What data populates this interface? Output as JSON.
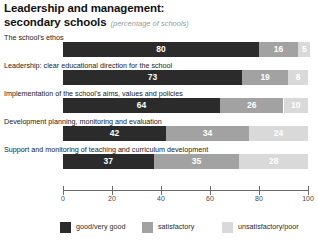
{
  "chart_data": {
    "type": "bar",
    "orientation": "horizontal",
    "stacked": true,
    "percent": true,
    "title": "Leadership and management:",
    "title_line2": "secondary schools",
    "subtitle": "(percentage of schools)",
    "xlabel": "",
    "ylabel": "",
    "xlim": [
      0,
      100
    ],
    "xticks": [
      0,
      20,
      40,
      60,
      80,
      100
    ],
    "xtick_labels": [
      "0",
      "20",
      "40",
      "60",
      "80",
      "100"
    ],
    "grid": false,
    "legend_position": "bottom",
    "categories": [
      "The school's ethos",
      "Leadership: clear educational direction for the school",
      "Implementation of the school's aims, values and policies",
      "Development planning, monitoring and evaluation",
      "Support and monitoring of teaching and curriculum development"
    ],
    "series": [
      {
        "name": "good/very good",
        "color": "#2b2b2b",
        "values": [
          80,
          73,
          64,
          42,
          37
        ]
      },
      {
        "name": "satisfactory",
        "color": "#a2a2a2",
        "values": [
          16,
          19,
          26,
          34,
          35
        ]
      },
      {
        "name": "unsatisfactory/poor",
        "color": "#d9d9d9",
        "values": [
          5,
          8,
          10,
          24,
          28
        ]
      }
    ],
    "legend": [
      "good/very good",
      "satisfactory",
      "unsatisfactory/poor"
    ]
  },
  "title": {
    "line1": "Leadership and management:",
    "line2": "secondary schools",
    "subtitle": "(percentage of schools)"
  },
  "rows": [
    {
      "label": "The school's ethos",
      "values": [
        80,
        16,
        5
      ],
      "value_labels": [
        "80",
        "16",
        "5"
      ]
    },
    {
      "label": "Leadership: clear educational direction for the school",
      "values": [
        73,
        19,
        8
      ],
      "value_labels": [
        "73",
        "19",
        "8"
      ]
    },
    {
      "label": "Implementation of the school's aims, values and policies",
      "values": [
        64,
        26,
        10
      ],
      "value_labels": [
        "64",
        "26",
        "10"
      ]
    },
    {
      "label": "Development planning, monitoring and evaluation",
      "values": [
        42,
        34,
        24
      ],
      "value_labels": [
        "42",
        "34",
        "24"
      ]
    },
    {
      "label": "Support and monitoring of teaching and curriculum development",
      "values": [
        37,
        35,
        28
      ],
      "value_labels": [
        "37",
        "35",
        "28"
      ]
    }
  ],
  "axis": {
    "labels": [
      "0",
      "20",
      "40",
      "60",
      "80",
      "100"
    ]
  },
  "legend": {
    "items": [
      {
        "label": "good/very good",
        "color": "#2b2b2b"
      },
      {
        "label": "satisfactory",
        "color": "#a2a2a2"
      },
      {
        "label": "unsatisfactory/poor",
        "color": "#d9d9d9"
      }
    ]
  },
  "colors": {
    "good": "#2b2b2b",
    "satisfactory": "#a2a2a2",
    "unsatisfactory": "#d9d9d9",
    "axis": "#6a6a6a",
    "subtitle": "#9a9a9a"
  }
}
